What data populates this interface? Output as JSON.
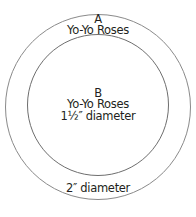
{
  "diagram": {
    "outer_circle": {
      "label_letter": "A",
      "label_name": "Yo-Yo Roses",
      "diameter_label": "2″ diameter",
      "stroke": "#8a8a8a"
    },
    "inner_circle": {
      "label_letter": "B",
      "label_name": "Yo-Yo Roses",
      "diameter_label": "1½″ diameter",
      "stroke": "#6e6e6e"
    }
  }
}
